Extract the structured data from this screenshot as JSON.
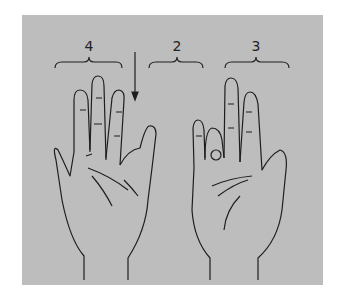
{
  "figure": {
    "groups": [
      {
        "label": "4",
        "hand": "left"
      },
      {
        "label": "2",
        "hand": "between"
      },
      {
        "label": "3",
        "hand": "right"
      }
    ],
    "colors": {
      "background": "#ffffff",
      "panel": "#bdbdbd",
      "ink": "#1e1e1e"
    }
  }
}
